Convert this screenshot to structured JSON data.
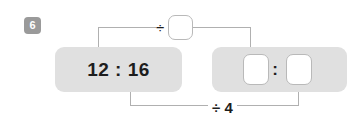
{
  "exercise": {
    "number": "6"
  },
  "given": {
    "panel_label": "12 : 16",
    "left_term": "12",
    "right_term": "16",
    "separator": ":"
  },
  "operations": {
    "top_divide_symbol": "÷",
    "top_divisor_value": "",
    "top_divisor_placeholder": "",
    "bottom_label": "÷ 4",
    "bottom_divisor": "4"
  },
  "answer": {
    "first_box_value": "",
    "second_box_value": "",
    "separator": ":"
  },
  "colors": {
    "panel": "#e0e0e0",
    "badge": "#9a9a9a",
    "connector": "#b0b0b0",
    "box_border": "#b9b9b9",
    "text": "#1d1d1d"
  }
}
